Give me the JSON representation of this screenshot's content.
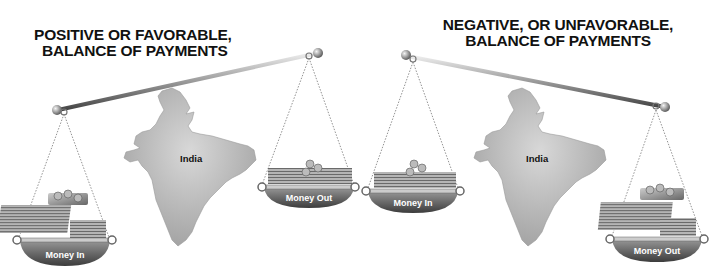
{
  "left_panel": {
    "title_line1": "POSITIVE OR FAVORABLE,",
    "title_line2": "BALANCE OF PAYMENTS",
    "country": "India",
    "heavy_pan_label": "Money In",
    "light_pan_label": "Money Out",
    "tilt": "left-side-down"
  },
  "right_panel": {
    "title_line1": "NEGATIVE, OR UNFAVORABLE,",
    "title_line2": "BALANCE OF PAYMENTS",
    "country": "India",
    "light_pan_label": "Money In",
    "heavy_pan_label": "Money Out",
    "tilt": "right-side-down"
  },
  "colors": {
    "beam": "#8a8a8a",
    "map": "#b4b4b4",
    "pan": "#6e6e6e",
    "text": "#111111"
  }
}
